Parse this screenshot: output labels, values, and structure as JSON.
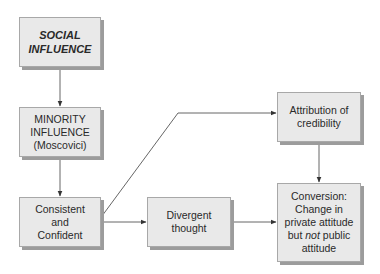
{
  "diagram": {
    "nodes": {
      "social_influence": {
        "lines": [
          "SOCIAL",
          "INFLUENCE"
        ]
      },
      "minority_influence": {
        "lines": [
          "MINORITY",
          "INFLUENCE",
          "(Moscovici)"
        ]
      },
      "consistent_confident": {
        "lines": [
          "Consistent",
          "and",
          "Confident"
        ]
      },
      "divergent_thought": {
        "lines": [
          "Divergent",
          "thought"
        ]
      },
      "attribution_credibility": {
        "lines": [
          "Attribution of",
          "credibility"
        ]
      },
      "conversion": {
        "line1": "Conversion:",
        "line2": "Change in",
        "line3": "private attitude",
        "line4_pre": "but ",
        "line4_em": "not",
        "line4_post": " public",
        "line5": "attitude"
      }
    },
    "edges": [
      {
        "from": "social_influence",
        "to": "minority_influence"
      },
      {
        "from": "minority_influence",
        "to": "consistent_confident"
      },
      {
        "from": "consistent_confident",
        "to": "divergent_thought"
      },
      {
        "from": "consistent_confident",
        "to": "attribution_credibility"
      },
      {
        "from": "divergent_thought",
        "to": "conversion"
      },
      {
        "from": "attribution_credibility",
        "to": "conversion"
      }
    ],
    "colors": {
      "box_fill": "#e9e9e9",
      "box_border": "#a8a8a8",
      "box_shadow": "#9c9c9c",
      "line": "#444444"
    }
  }
}
